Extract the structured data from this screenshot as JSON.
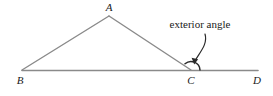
{
  "figure": {
    "type": "geometry-diagram",
    "background_color": "#ffffff",
    "line_color": "#8a8a8a",
    "annotation_color": "#1a1a1a",
    "arc_color": "#2a2a2a"
  },
  "vertices": [
    {
      "id": "A",
      "label": "A",
      "x": 109,
      "y": 16,
      "label_x": 109,
      "label_y": 11
    },
    {
      "id": "B",
      "label": "B",
      "x": 22,
      "y": 70,
      "label_x": 20,
      "label_y": 84
    },
    {
      "id": "C",
      "label": "C",
      "x": 191,
      "y": 70,
      "label_x": 191,
      "label_y": 84
    },
    {
      "id": "D",
      "label": "D",
      "x": 258,
      "y": 70,
      "label_x": 257,
      "label_y": 84
    }
  ],
  "segments": [
    {
      "name": "segment-BA",
      "from": "B",
      "to": "A"
    },
    {
      "name": "segment-AC",
      "from": "A",
      "to": "C"
    },
    {
      "name": "line-BD",
      "from": "B",
      "to": "D"
    }
  ],
  "annotations": {
    "exterior_angle": {
      "text": "exterior angle",
      "text_x": 200,
      "text_y": 28,
      "leader_from_x": 205,
      "leader_from_y": 34,
      "leader_to_x": 194,
      "leader_to_y": 63
    }
  },
  "angle_marks": [
    {
      "name": "exterior-angle-arc",
      "at_vertex": "C",
      "between": [
        "CA",
        "CD"
      ],
      "radius": 9
    }
  ]
}
